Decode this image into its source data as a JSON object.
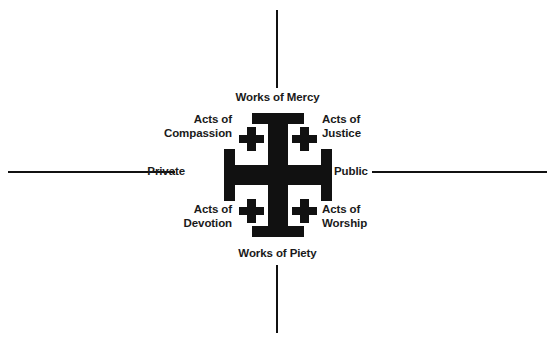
{
  "diagram": {
    "background_color": "#ffffff",
    "ink_color": "#111111"
  },
  "axes": {
    "vertical": {
      "top_label": "Works of Mercy",
      "bottom_label": "Works of Piety"
    },
    "horizontal": {
      "left_label": "Private",
      "right_label": "Public"
    }
  },
  "quadrants": [
    {
      "position": "top-left",
      "line1": "Acts of",
      "line2": "Compassion"
    },
    {
      "position": "top-right",
      "line1": "Acts of",
      "line2": "Justice"
    },
    {
      "position": "bottom-left",
      "line1": "Acts of",
      "line2": "Devotion"
    },
    {
      "position": "bottom-right",
      "line1": "Acts of",
      "line2": "Worship"
    }
  ],
  "labels": {
    "works_of_mercy": "Works of Mercy",
    "works_of_piety": "Works of Piety",
    "private": "Private",
    "public": "Public",
    "acts_of_compassion": "Acts of\nCompassion",
    "acts_of_justice": "Acts of\nJustice",
    "acts_of_devotion": "Acts of\nDevotion",
    "acts_of_worship": "Acts of\nWorship"
  },
  "symbol": {
    "name": "jerusalem-cross",
    "fill_color": "#111111",
    "description": "Large cross potent with four small Greek crosses in the quadrants"
  }
}
